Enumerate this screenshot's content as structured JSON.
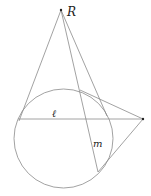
{
  "diagram": {
    "type": "geometry",
    "labels": {
      "point_R": "R",
      "line_l": "ℓ",
      "line_m": "m"
    },
    "circle": {
      "cx": 63.5,
      "cy": 138.5,
      "r": 49.5
    },
    "points": {
      "R": [
        61,
        10
      ],
      "right_external": [
        143,
        119
      ],
      "left_tangent": [
        21,
        113
      ],
      "top_tangent": [
        107,
        117
      ],
      "line_l_left": [
        18,
        119
      ],
      "upper_tangent_right": [
        80,
        91
      ],
      "lower_tangent_right": [
        98,
        172
      ],
      "m_end": [
        98,
        172
      ]
    },
    "colors": {
      "stroke": "#8a8a8a",
      "point": "#222222"
    }
  }
}
